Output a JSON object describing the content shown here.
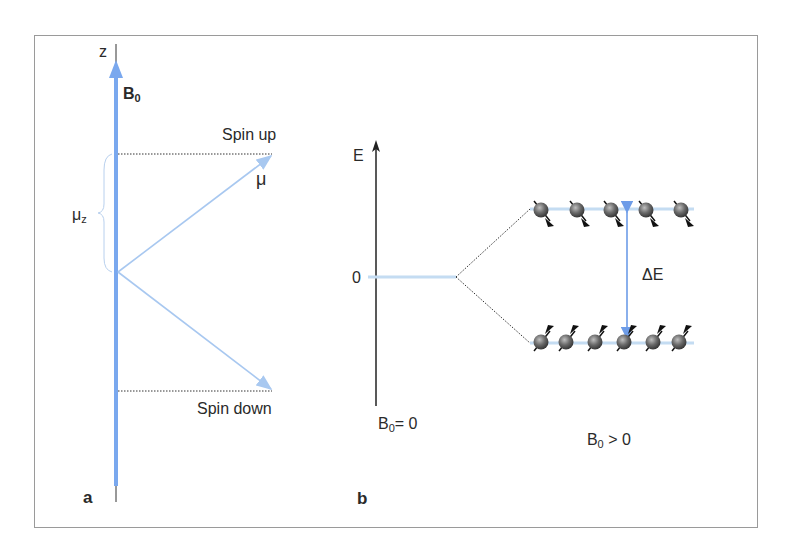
{
  "panel_a": {
    "label": "a",
    "axis_label": "z",
    "field_label": "B",
    "field_subscript": "0",
    "spin_up_label": "Spin up",
    "spin_down_label": "Spin down",
    "moment_label": "μ",
    "z_component_label": "μ",
    "z_component_subscript": "z"
  },
  "panel_b": {
    "label": "b",
    "energy_axis_label": "E",
    "zero_label": "0",
    "delta_e_label": "ΔE",
    "left_condition": {
      "symbol": "B",
      "subscript": "0",
      "relation": "= 0"
    },
    "right_condition": {
      "symbol": "B",
      "subscript": "0",
      "relation": " > 0"
    },
    "upper_level": {
      "spin": "down",
      "count": 5
    },
    "lower_level": {
      "spin": "up",
      "count": 6
    }
  },
  "colors": {
    "field_blue": "#7aa8ee",
    "vector_blue": "#a8c8f0",
    "level_blue": "#c4dcf2",
    "axis_black": "#222222",
    "frame_gray": "#9a9a9a",
    "sphere_gray": "#555555"
  }
}
